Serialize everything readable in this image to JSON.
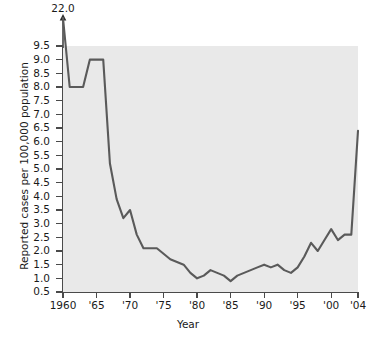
{
  "chart_data": {
    "type": "line",
    "title": "",
    "xlabel": "Year",
    "ylabel": "Reported cases per 100,000 population",
    "xlim": [
      1960,
      2004
    ],
    "ylim": [
      0.5,
      9.5
    ],
    "grid": false,
    "legend": null,
    "axis_break": {
      "label": "22.0",
      "note": "y-axis is broken; 1960 value of 22.0 is drawn off-scale with an up arrow"
    },
    "ytick_labels": [
      "9.5",
      "9.0",
      "8.5",
      "8.0",
      "7.5",
      "7.0",
      "6.5",
      "6.0",
      "5.5",
      "5.0",
      "4.5",
      "4.0",
      "3.5",
      "3.0",
      "2.5",
      "2.0",
      "1.5",
      "1.0",
      "0.5"
    ],
    "ytick_values": [
      9.5,
      9.0,
      8.5,
      8.0,
      7.5,
      7.0,
      6.5,
      6.0,
      5.5,
      5.0,
      4.5,
      4.0,
      3.5,
      3.0,
      2.5,
      2.0,
      1.5,
      1.0,
      0.5
    ],
    "xtick_labels": [
      "1960",
      "'65",
      "'70",
      "'75",
      "'80",
      "'85",
      "'90",
      "'95",
      "'00",
      "'04"
    ],
    "xtick_values": [
      1960,
      1965,
      1970,
      1975,
      1980,
      1985,
      1990,
      1995,
      2000,
      2004
    ],
    "line_color": "#5a5a5a",
    "plot_background": "#e9e9e9",
    "x": [
      1960,
      1961,
      1962,
      1963,
      1964,
      1965,
      1966,
      1967,
      1968,
      1969,
      1970,
      1971,
      1972,
      1973,
      1974,
      1975,
      1976,
      1977,
      1978,
      1979,
      1980,
      1981,
      1982,
      1983,
      1984,
      1985,
      1986,
      1987,
      1988,
      1989,
      1990,
      1991,
      1992,
      1993,
      1994,
      1995,
      1996,
      1997,
      1998,
      1999,
      2000,
      2001,
      2002,
      2003,
      2004
    ],
    "y": [
      22.0,
      8.0,
      8.0,
      8.0,
      9.0,
      9.0,
      9.0,
      5.2,
      3.9,
      3.2,
      3.5,
      2.6,
      2.1,
      2.1,
      2.1,
      1.9,
      1.7,
      1.6,
      1.5,
      1.2,
      1.0,
      1.1,
      1.3,
      1.2,
      1.1,
      0.9,
      1.1,
      1.2,
      1.3,
      1.4,
      1.5,
      1.4,
      1.5,
      1.3,
      1.2,
      1.4,
      1.8,
      2.3,
      2.0,
      2.4,
      2.8,
      2.4,
      2.6,
      2.6,
      6.4
    ]
  }
}
